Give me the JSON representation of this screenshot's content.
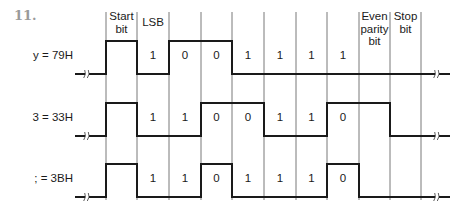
{
  "problem_number": "11.",
  "grid": {
    "boundaries_x": [
      106,
      137,
      169,
      201,
      232,
      264,
      296,
      327,
      359,
      390,
      421
    ],
    "line_top": 12,
    "line_bottom": 200,
    "lead_start_x": 75,
    "trail_end_x": 450,
    "left_break_x": 87,
    "right_break_x": 437
  },
  "headers": [
    {
      "cell": 0,
      "text": "Start bit",
      "lines": [
        "Start",
        "bit"
      ]
    },
    {
      "cell": 1,
      "text": "LSB",
      "lines": [
        "LSB"
      ]
    },
    {
      "cell": 8,
      "text": "Even parity bit",
      "lines": [
        "Even",
        "parity",
        "bit"
      ]
    },
    {
      "cell": 9,
      "text": "Stop bit",
      "lines": [
        "Stop",
        "bit"
      ]
    }
  ],
  "rows": [
    {
      "label": "y = 79H",
      "high_y": 41,
      "low_y": 74,
      "label_y": 57,
      "data_bits": [
        "1",
        "0",
        "0",
        "1",
        "1",
        "1",
        "1"
      ],
      "levels": [
        "H",
        "L",
        "H",
        "H",
        "L",
        "L",
        "L",
        "L",
        "L",
        "L"
      ]
    },
    {
      "label": "3 = 33H",
      "high_y": 103,
      "low_y": 136,
      "label_y": 119,
      "data_bits": [
        "1",
        "1",
        "0",
        "0",
        "1",
        "1",
        "0"
      ],
      "levels": [
        "H",
        "L",
        "L",
        "H",
        "H",
        "L",
        "L",
        "H",
        "H",
        "L"
      ]
    },
    {
      "label": "; = 3BH",
      "high_y": 164,
      "low_y": 197,
      "label_y": 180,
      "data_bits": [
        "1",
        "1",
        "0",
        "1",
        "1",
        "1",
        "0"
      ],
      "levels": [
        "H",
        "L",
        "L",
        "H",
        "L",
        "L",
        "L",
        "H",
        "L",
        "L"
      ]
    }
  ]
}
